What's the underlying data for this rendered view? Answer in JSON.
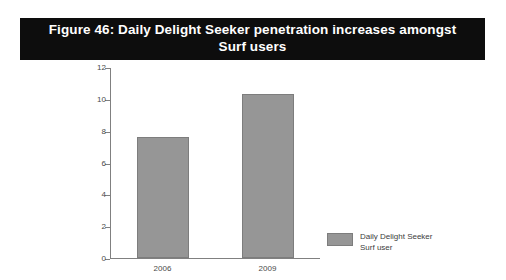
{
  "title": {
    "text": "Figure 46: Daily Delight Seeker penetration increases amongst Surf users"
  },
  "legend": {
    "label": "Daily Delight Seeker\nSurf user",
    "swatch_color": "#969696"
  },
  "colors": {
    "bar_fill": "#969696",
    "bar_stroke": "#7d7d7d",
    "axis": "#808080",
    "title_background": "#0d0d0d",
    "title_text": "#ffffff",
    "tick_text": "#4a4a4a"
  },
  "chart_data": {
    "type": "bar",
    "title": "Figure 46: Daily Delight Seeker penetration increases amongst Surf users",
    "xlabel": "",
    "ylabel": "",
    "categories": [
      "2006",
      "2009"
    ],
    "series": [
      {
        "name": "Daily Delight Seeker Surf user",
        "values": [
          7.6,
          10.3
        ],
        "color": "#969696"
      }
    ],
    "ylim": [
      0,
      12
    ],
    "yticks": [
      0,
      2,
      4,
      6,
      8,
      10,
      12
    ],
    "ytick_labels": [
      "0",
      "2",
      "4",
      "6",
      "8",
      "10",
      "12"
    ],
    "grid": false,
    "legend_position": "right"
  }
}
